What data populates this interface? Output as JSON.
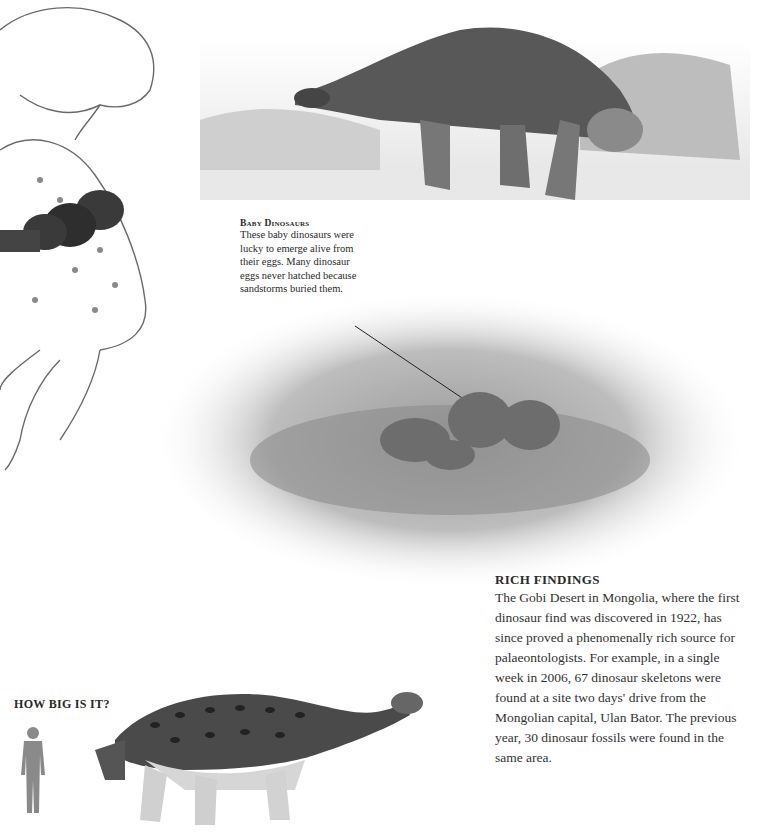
{
  "captions": {
    "baby_dinosaurs": {
      "title": "Baby Dinosaurs",
      "lines": [
        "These baby dinosaurs were",
        "lucky to emerge alive from",
        "their eggs. Many dinosaur",
        "eggs never hatched because",
        "sandstorms buried them."
      ]
    }
  },
  "rich_findings": {
    "title": "RICH FINDINGS",
    "lines": [
      "The Gobi Desert in Mongolia, where the first",
      "dinosaur find was discovered in 1922, has",
      "since proved a phenomenally rich source for",
      "palaeontologists. For example, in a single",
      "week in 2006, 67 dinosaur skeletons were",
      "found at a site two days' drive from the",
      "Mongolian capital, Ulan Bator. The previous",
      "year, 30 dinosaur fossils were found in the",
      "same area."
    ]
  },
  "how_big": {
    "title": "HOW BIG IS IT?"
  },
  "illustrations": {
    "theropod": "tyrannosaur-illustration",
    "ankylosaur_top": "pinacosaurus-illustration",
    "babies": "baby-dinosaurs-nest-illustration",
    "scale_human": "human-silhouette",
    "scale_dino": "ankylosaur-scale-illustration"
  }
}
